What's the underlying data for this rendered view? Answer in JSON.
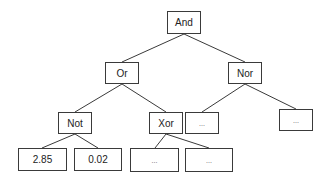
{
  "diagram": {
    "type": "tree",
    "colors": {
      "line": "#3a3a3a",
      "text": "#222222",
      "background": "#ffffff"
    },
    "nodes": {
      "and": {
        "label": "And"
      },
      "or": {
        "label": "Or"
      },
      "nor": {
        "label": "Nor"
      },
      "not": {
        "label": "Not"
      },
      "xor": {
        "label": "Xor"
      },
      "nor_left": {
        "label": "..."
      },
      "nor_right": {
        "label": "..."
      },
      "leaf_285": {
        "label": "2.85"
      },
      "leaf_002": {
        "label": "0.02"
      },
      "xor_left": {
        "label": "..."
      },
      "xor_right": {
        "label": "..."
      }
    },
    "edges": [
      [
        "And",
        "Or"
      ],
      [
        "And",
        "Nor"
      ],
      [
        "Or",
        "Not"
      ],
      [
        "Or",
        "Xor"
      ],
      [
        "Nor",
        "..."
      ],
      [
        "Nor",
        "..."
      ],
      [
        "Not",
        "2.85"
      ],
      [
        "Not",
        "0.02"
      ],
      [
        "Xor",
        "..."
      ],
      [
        "Xor",
        "..."
      ]
    ]
  }
}
